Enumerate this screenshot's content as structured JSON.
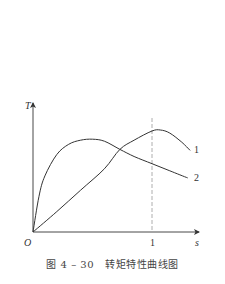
{
  "figure": {
    "caption_number": "图 4 – 30",
    "caption_title": "转矩特性曲线图",
    "caption": "图 4 – 30   转矩特性曲线图"
  },
  "axes": {
    "x_label": "s",
    "y_label": "T",
    "origin_label": "O",
    "x_tick_label": "1"
  },
  "curve_labels": {
    "curve1": "1",
    "curve2": "2"
  },
  "colors": {
    "line": "#333333",
    "dashed": "#999999",
    "background": "#ffffff"
  },
  "chart_data": {
    "type": "line",
    "title": "转矩特性曲线图",
    "figure_label": "图 4 – 30",
    "xlabel": "s",
    "ylabel": "T",
    "xlim": [
      0,
      1.38
    ],
    "ylim": [
      0,
      1.25
    ],
    "grid": false,
    "legend": "inline labels at curve ends (1, 2)",
    "x_ticks": [
      {
        "value": 1,
        "label": "1"
      }
    ],
    "reference_lines": [
      {
        "type": "vertical",
        "x": 1,
        "style": "dashed"
      }
    ],
    "origin_label": "O",
    "series": [
      {
        "name": "1",
        "x": [
          0,
          0.2,
          0.4,
          0.6,
          0.73,
          0.85,
          1.0,
          1.07,
          1.15,
          1.25,
          1.32
        ],
        "y": [
          0,
          0.2,
          0.41,
          0.62,
          0.81,
          0.9,
          0.99,
          1.0,
          0.97,
          0.88,
          0.8
        ]
      },
      {
        "name": "2",
        "x": [
          0,
          0.05,
          0.1,
          0.2,
          0.3,
          0.4,
          0.5,
          0.6,
          0.73,
          0.85,
          1.0,
          1.15,
          1.3
        ],
        "y": [
          0,
          0.35,
          0.55,
          0.76,
          0.86,
          0.9,
          0.91,
          0.89,
          0.81,
          0.74,
          0.67,
          0.6,
          0.53
        ]
      }
    ]
  }
}
